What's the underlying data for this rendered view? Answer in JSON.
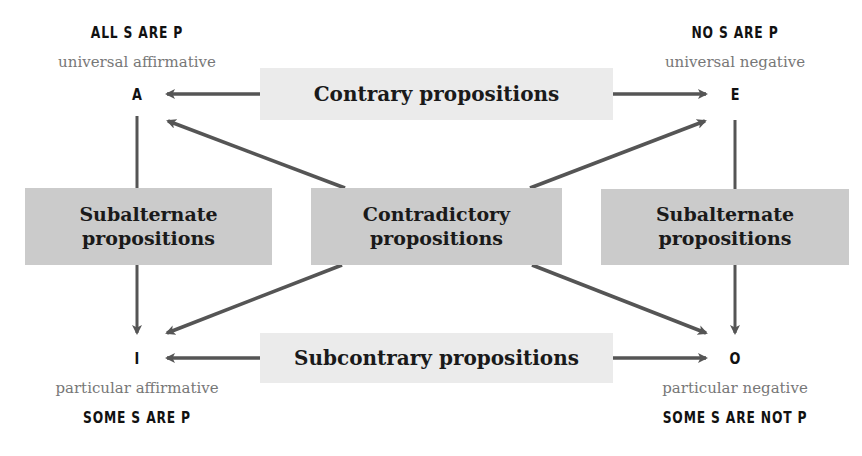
{
  "corners": {
    "A": {
      "letter": "A",
      "heading": "ALL S ARE P",
      "subtitle": "universal affirmative"
    },
    "E": {
      "letter": "E",
      "heading": "NO S ARE P",
      "subtitle": "universal negative"
    },
    "I": {
      "letter": "I",
      "heading": "SOME S ARE P",
      "subtitle": "particular affirmative"
    },
    "O": {
      "letter": "O",
      "heading": "SOME S ARE NOT P",
      "subtitle": "particular negative"
    }
  },
  "relations": {
    "contrary": "Contrary propositions",
    "subcontrary": "Subcontrary propositions",
    "contradictory": {
      "line1": "Contradictory",
      "line2": "propositions"
    },
    "subalternate_left": {
      "line1": "Subalternate",
      "line2": "propositions"
    },
    "subalternate_right": {
      "line1": "Subalternate",
      "line2": "propositions"
    }
  },
  "colors": {
    "arrow": "#555555",
    "box_light": "#ebebeb",
    "box_dark": "#cbcbcb",
    "heading": "#111111",
    "subtitle": "#777777"
  }
}
